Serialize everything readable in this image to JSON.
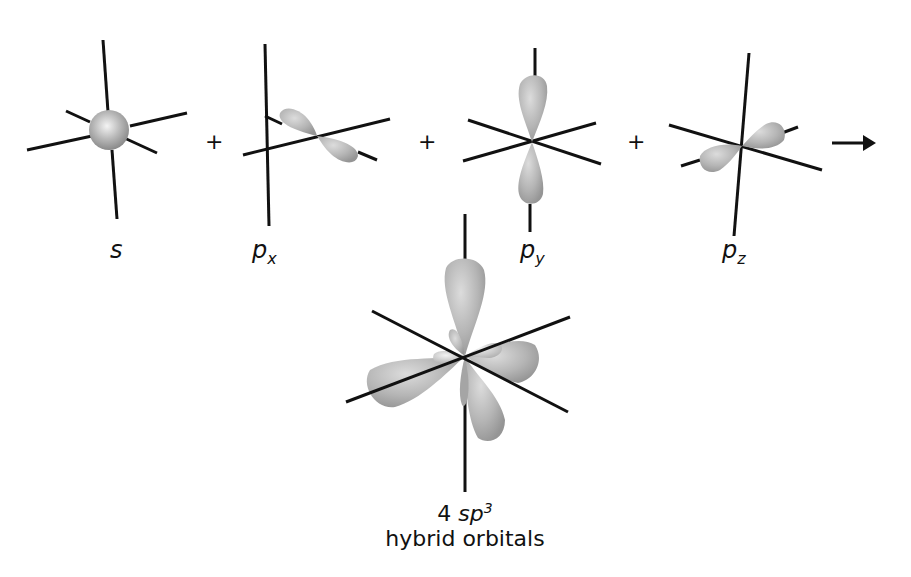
{
  "diagram": {
    "colors": {
      "axis": "#111111",
      "lobe_fill": "#b8b8b8",
      "lobe_highlight": "#e2e2e2",
      "lobe_shadow": "#8e8e8e"
    },
    "orbitals": [
      {
        "id": "s",
        "label": "s",
        "subscript": "",
        "shape": "sphere"
      },
      {
        "id": "px",
        "label": "p",
        "subscript": "x",
        "shape": "dumbbell"
      },
      {
        "id": "py",
        "label": "p",
        "subscript": "y",
        "shape": "dumbbell-vertical"
      },
      {
        "id": "pz",
        "label": "p",
        "subscript": "z",
        "shape": "dumbbell"
      }
    ],
    "operators": [
      "+",
      "+",
      "+"
    ],
    "arrow": "→",
    "result": {
      "count": "4",
      "hybrid": "sp",
      "superscript": "3",
      "caption_line2": "hybrid orbitals"
    }
  }
}
